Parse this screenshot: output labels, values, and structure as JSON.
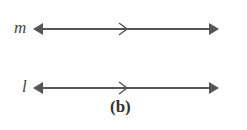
{
  "diagram": {
    "lines": [
      {
        "label": "m",
        "y": 29
      },
      {
        "label": "l",
        "y": 88
      }
    ],
    "caption": "(b)",
    "color": "#555555"
  }
}
